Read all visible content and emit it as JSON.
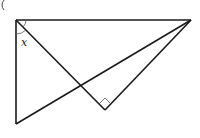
{
  "diagram": {
    "type": "geometry",
    "stroke_color": "#1a1a1a",
    "background": "#ffffff",
    "points": {
      "A": [
        16,
        20
      ],
      "B": [
        191,
        20
      ],
      "C": [
        16,
        124
      ],
      "D": [
        105,
        110
      ]
    },
    "segments": [
      [
        "A",
        "B"
      ],
      [
        "A",
        "C"
      ],
      [
        "A",
        "D"
      ],
      [
        "D",
        "B"
      ],
      [
        "C",
        "B"
      ]
    ],
    "angle_label": "x",
    "right_angle_at": "D",
    "partial_marker": "("
  }
}
